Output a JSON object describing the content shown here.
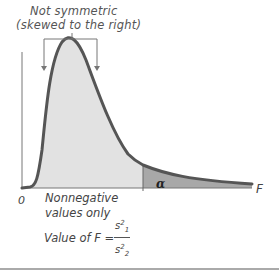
{
  "diagram": {
    "annotation": {
      "line1": "Not symmetric",
      "line2": "(skewed to the right)"
    },
    "axis": {
      "origin_label": "0",
      "x_label": "F"
    },
    "notes": {
      "nonnegative_line1": "Nonnegative",
      "nonnegative_line2": "values only",
      "value_of_f": "Value of F =",
      "fraction_numerator": "s",
      "numerator_sup": "2",
      "numerator_sub": "1",
      "fraction_denominator": "s",
      "denominator_sup": "2",
      "denominator_sub": "2"
    },
    "tail_label": "α",
    "colors": {
      "curve": "#555555",
      "body_fill": "#e2e2e2",
      "tail_fill": "#a8a8a8",
      "axis": "#777777",
      "text": "#444444"
    }
  }
}
